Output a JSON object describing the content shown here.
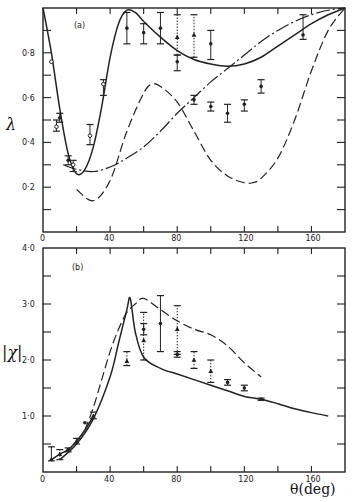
{
  "chart_data": [
    {
      "type": "line",
      "panel_label": "(a)",
      "title": "",
      "xlabel": "",
      "ylabel": "λ",
      "xlim": [
        0,
        180
      ],
      "ylim": [
        0,
        1.0
      ],
      "x_ticks": [
        0,
        40,
        80,
        120,
        160
      ],
      "x_tick_labels": [
        "0",
        "40",
        "80",
        "120",
        "160"
      ],
      "y_ticks": [
        0.2,
        0.4,
        0.6,
        0.8
      ],
      "y_tick_labels": [
        "0·2",
        "0·4",
        "0·6",
        "0·8"
      ],
      "grid": false,
      "series": [
        {
          "name": "solid curve",
          "style": "solid",
          "x": [
            0,
            5,
            10,
            15,
            20,
            25,
            30,
            35,
            40,
            45,
            50,
            55,
            60,
            70,
            80,
            90,
            100,
            110,
            120,
            130,
            140,
            150,
            160,
            170,
            180
          ],
          "y": [
            1.0,
            0.8,
            0.55,
            0.35,
            0.26,
            0.28,
            0.38,
            0.56,
            0.78,
            0.93,
            0.99,
            0.98,
            0.94,
            0.87,
            0.81,
            0.77,
            0.75,
            0.74,
            0.75,
            0.78,
            0.83,
            0.88,
            0.93,
            0.97,
            1.0
          ]
        },
        {
          "name": "long-dashed curve",
          "style": "dashed",
          "x": [
            20,
            30,
            40,
            50,
            60,
            65,
            70,
            80,
            90,
            100,
            110,
            120,
            125,
            130,
            140,
            150,
            160,
            170,
            180
          ],
          "y": [
            0.19,
            0.14,
            0.23,
            0.45,
            0.62,
            0.66,
            0.65,
            0.58,
            0.45,
            0.32,
            0.25,
            0.22,
            0.22,
            0.24,
            0.33,
            0.5,
            0.72,
            0.9,
            1.0
          ]
        },
        {
          "name": "dash-dot curve",
          "style": "dash-dot",
          "x": [
            12,
            20,
            30,
            40,
            50,
            60,
            70,
            80,
            90,
            100,
            110,
            120,
            130,
            140,
            150,
            160,
            170,
            180
          ],
          "y": [
            0.3,
            0.28,
            0.27,
            0.29,
            0.33,
            0.38,
            0.45,
            0.53,
            0.6,
            0.67,
            0.73,
            0.79,
            0.85,
            0.9,
            0.94,
            0.97,
            0.99,
            1.0
          ]
        }
      ],
      "data_points": [
        {
          "x": 5,
          "y": 0.76,
          "lo": 0.76,
          "hi": 0.76,
          "marker": "open"
        },
        {
          "x": 8,
          "y": 0.47,
          "lo": 0.45,
          "hi": 0.5,
          "marker": "open"
        },
        {
          "x": 10,
          "y": 0.51,
          "lo": 0.49,
          "hi": 0.53,
          "marker": "filled"
        },
        {
          "x": 15,
          "y": 0.32,
          "lo": 0.3,
          "hi": 0.34,
          "marker": "filled"
        },
        {
          "x": 18,
          "y": 0.3,
          "lo": 0.27,
          "hi": 0.32,
          "marker": "open"
        },
        {
          "x": 28,
          "y": 0.43,
          "lo": 0.39,
          "hi": 0.48,
          "marker": "open"
        },
        {
          "x": 36,
          "y": 0.66,
          "lo": 0.61,
          "hi": 0.68,
          "marker": "open"
        },
        {
          "x": 50,
          "y": 0.91,
          "lo": 0.84,
          "hi": 0.98,
          "marker": "filled"
        },
        {
          "x": 60,
          "y": 0.89,
          "lo": 0.84,
          "hi": 0.93,
          "marker": "filled"
        },
        {
          "x": 70,
          "y": 0.91,
          "lo": 0.84,
          "hi": 0.98,
          "marker": "filled"
        },
        {
          "x": 80,
          "y": 0.76,
          "lo": 0.72,
          "hi": 0.79,
          "marker": "filled"
        },
        {
          "x": 80,
          "y": 0.87,
          "lo": 0.79,
          "hi": 0.97,
          "marker": "triangle"
        },
        {
          "x": 90,
          "y": 0.88,
          "lo": 0.78,
          "hi": 0.97,
          "marker": "triangle"
        },
        {
          "x": 90,
          "y": 0.59,
          "lo": 0.57,
          "hi": 0.61,
          "marker": "filled"
        },
        {
          "x": 100,
          "y": 0.84,
          "lo": 0.77,
          "hi": 0.9,
          "marker": "filled"
        },
        {
          "x": 100,
          "y": 0.56,
          "lo": 0.54,
          "hi": 0.58,
          "marker": "filled"
        },
        {
          "x": 110,
          "y": 0.53,
          "lo": 0.49,
          "hi": 0.57,
          "marker": "filled"
        },
        {
          "x": 120,
          "y": 0.57,
          "lo": 0.54,
          "hi": 0.59,
          "marker": "filled"
        },
        {
          "x": 130,
          "y": 0.65,
          "lo": 0.62,
          "hi": 0.68,
          "marker": "filled"
        },
        {
          "x": 155,
          "y": 0.88,
          "lo": 0.86,
          "hi": 0.97,
          "marker": "filled"
        }
      ]
    },
    {
      "type": "line",
      "panel_label": "(b)",
      "title": "",
      "xlabel": "θ(deg)",
      "ylabel": "|χ|",
      "xlim": [
        0,
        180
      ],
      "ylim": [
        0,
        4.0
      ],
      "x_ticks": [
        0,
        40,
        80,
        120,
        160
      ],
      "x_tick_labels": [
        "0",
        "40",
        "80",
        "120",
        "160"
      ],
      "y_ticks": [
        1.0,
        2.0,
        3.0,
        4.0
      ],
      "y_tick_labels": [
        "1·0",
        "2·0",
        "3·0",
        "4·0"
      ],
      "grid": false,
      "series": [
        {
          "name": "solid curve",
          "style": "solid",
          "x": [
            10,
            20,
            30,
            40,
            45,
            50,
            52,
            55,
            60,
            70,
            80,
            90,
            100,
            110,
            120,
            130,
            140,
            150,
            160,
            170
          ],
          "y": [
            0.22,
            0.5,
            0.95,
            1.7,
            2.3,
            2.9,
            3.1,
            2.5,
            2.05,
            1.85,
            1.75,
            1.65,
            1.55,
            1.45,
            1.35,
            1.3,
            1.22,
            1.13,
            1.06,
            1.0
          ]
        },
        {
          "name": "dashed curve",
          "style": "dashed",
          "x": [
            25,
            30,
            35,
            40,
            45,
            50,
            55,
            60,
            70,
            80,
            90,
            100,
            110,
            120,
            130
          ],
          "y": [
            0.75,
            1.15,
            1.65,
            2.15,
            2.55,
            2.85,
            3.0,
            3.1,
            2.9,
            2.7,
            2.55,
            2.45,
            2.25,
            1.95,
            1.7
          ]
        },
        {
          "name": "fit line",
          "style": "solid",
          "x": [
            5,
            10,
            15,
            20,
            25,
            30
          ],
          "y": [
            0.22,
            0.32,
            0.4,
            0.55,
            0.75,
            1.0
          ]
        }
      ],
      "data_points": [
        {
          "x": 5,
          "y": 0.22,
          "lo": 0.2,
          "hi": 0.45,
          "marker": "filled"
        },
        {
          "x": 10,
          "y": 0.32,
          "lo": 0.22,
          "hi": 0.4,
          "marker": "triangle"
        },
        {
          "x": 15,
          "y": 0.4,
          "lo": 0.36,
          "hi": 0.43,
          "marker": "filled"
        },
        {
          "x": 20,
          "y": 0.55,
          "lo": 0.5,
          "hi": 0.6,
          "marker": "triangle"
        },
        {
          "x": 25,
          "y": 0.88,
          "lo": 0.88,
          "hi": 0.88,
          "marker": "filled"
        },
        {
          "x": 30,
          "y": 1.0,
          "lo": 0.95,
          "hi": 1.07,
          "marker": "triangle"
        },
        {
          "x": 50,
          "y": 1.98,
          "lo": 1.9,
          "hi": 2.15,
          "marker": "triangle"
        },
        {
          "x": 60,
          "y": 2.35,
          "lo": 2.0,
          "hi": 2.85,
          "marker": "triangle"
        },
        {
          "x": 60,
          "y": 2.55,
          "lo": 2.45,
          "hi": 2.65,
          "marker": "filled"
        },
        {
          "x": 70,
          "y": 2.65,
          "lo": 2.15,
          "hi": 3.15,
          "marker": "filled"
        },
        {
          "x": 80,
          "y": 2.1,
          "lo": 2.05,
          "hi": 2.15,
          "marker": "filled"
        },
        {
          "x": 80,
          "y": 2.55,
          "lo": 2.1,
          "hi": 2.97,
          "marker": "triangle"
        },
        {
          "x": 90,
          "y": 2.0,
          "lo": 1.85,
          "hi": 2.15,
          "marker": "triangle"
        },
        {
          "x": 100,
          "y": 1.8,
          "lo": 1.6,
          "hi": 2.0,
          "marker": "triangle"
        },
        {
          "x": 110,
          "y": 1.6,
          "lo": 1.55,
          "hi": 1.65,
          "marker": "filled"
        },
        {
          "x": 120,
          "y": 1.5,
          "lo": 1.45,
          "hi": 1.55,
          "marker": "filled"
        },
        {
          "x": 130,
          "y": 1.3,
          "lo": 1.28,
          "hi": 1.32,
          "marker": "filled"
        }
      ]
    }
  ],
  "figure": {
    "panel_a_label": "(a)",
    "panel_b_label": "(b)",
    "y_label_top": "λ",
    "y_label_bottom": "|χ|",
    "x_label": "θ(deg)",
    "x_tick_labels": [
      "0",
      "40",
      "80",
      "120",
      "160"
    ],
    "top_y_tick_labels": [
      "0·2",
      "0·4",
      "0·6",
      "0·8"
    ],
    "bottom_y_tick_labels": [
      "1·0",
      "2·0",
      "3·0",
      "4·0"
    ]
  }
}
